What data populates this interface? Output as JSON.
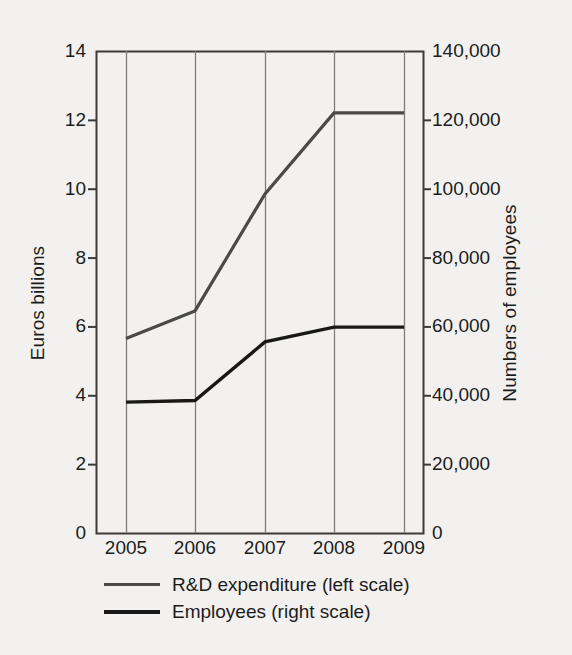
{
  "chart_data": {
    "type": "line",
    "title": "",
    "xlabel": "",
    "ylabel": "Euros billions",
    "ylabel_right": "Numbers of employees",
    "categories": [
      "2005",
      "2006",
      "2007",
      "2008",
      "2009"
    ],
    "x": [
      2005,
      2006,
      2007,
      2008,
      2009
    ],
    "ylim": [
      0,
      14
    ],
    "ylim_right": [
      0,
      140000
    ],
    "yticks": [
      "0",
      "2",
      "4",
      "6",
      "8",
      "10",
      "12",
      "14"
    ],
    "ytick_values": [
      0,
      2,
      4,
      6,
      8,
      10,
      12,
      14
    ],
    "yticks_right": [
      "0",
      "20,000",
      "40,000",
      "60,000",
      "80,000",
      "100,000",
      "120,000",
      "140,000"
    ],
    "ytick_values_right": [
      0,
      20000,
      40000,
      60000,
      80000,
      100000,
      120000,
      140000
    ],
    "grid": "vertical",
    "legend_position": "below",
    "series": [
      {
        "name": "R&D expenditure (left scale)",
        "axis": "left",
        "color": "#4a4a4a",
        "width": 3.2,
        "values": [
          5.65,
          6.45,
          9.85,
          12.2,
          12.2
        ]
      },
      {
        "name": "Employees (right scale)",
        "axis": "right",
        "color": "#181818",
        "width": 3.4,
        "values": [
          38000,
          38500,
          55500,
          59800,
          59800
        ]
      }
    ]
  },
  "figure": {
    "background_color": "#f2f1ef",
    "axis_color": "#3a3a3a",
    "grid_color": "#7d7d7d",
    "legend": {
      "items": [
        {
          "label": "R&D expenditure (left scale)",
          "color": "#4a4a4a",
          "thickness": "3px"
        },
        {
          "label": "Employees (right scale)",
          "color": "#181818",
          "thickness": "4px"
        }
      ]
    }
  }
}
